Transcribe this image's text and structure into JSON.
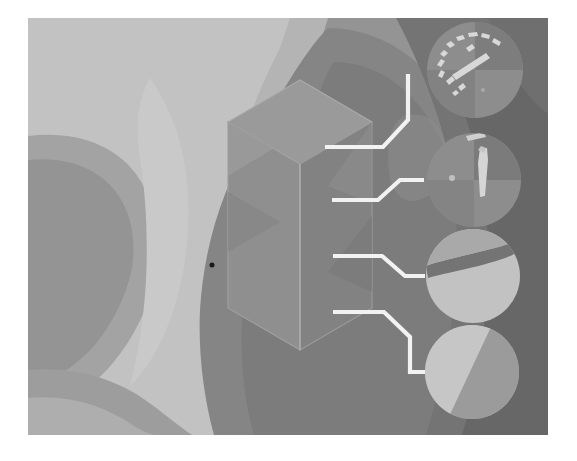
{
  "figure": {
    "domain": "scientific-visualization",
    "kind": "contour-field-map-with-isometric-cell-and-circular-insets",
    "caption": "",
    "canvas": {
      "x": 28,
      "y": 18,
      "width": 520,
      "height": 417,
      "page_background": "#ffffff",
      "plot_background": "#8f8f8f"
    },
    "palette": {
      "level_0_lightest": "#c9c9c9",
      "level_1_light": "#b4b4b4",
      "level_2_midlight": "#a3a3a3",
      "level_3_mid": "#949494",
      "level_4_middark": "#858585",
      "level_5_dark": "#747474",
      "level_6_darkest": "#636363",
      "box_top_face": "#9a9a9a",
      "box_left_face": "#8c8c8c",
      "box_right_face": "#7e7e7e",
      "box_edge": "#a8a8a8",
      "leader_line": "#f2f2f2",
      "marker_dot": "#1a1a1a",
      "inset_light": "#c2c2c2",
      "inset_mid": "#9b9b9b",
      "inset_dark": "#6f6f6f",
      "inset_highlight": "#dedede"
    }
  },
  "contour_field": {
    "description": "Grayscale stepped contour bands forming a lobed field across the frame",
    "level_count": 7,
    "bands": [
      {
        "id": "band-background",
        "level": 3,
        "fill": "#949494"
      },
      {
        "id": "band-upper-left-plateau",
        "level": 1,
        "fill": "#b4b4b4"
      },
      {
        "id": "band-left-valley-core",
        "level": 0,
        "fill": "#c9c9c9"
      },
      {
        "id": "band-left-ridge",
        "level": 4,
        "fill": "#858585"
      },
      {
        "id": "band-central-dome",
        "level": 4,
        "fill": "#858585"
      },
      {
        "id": "band-lower-basin",
        "level": 2,
        "fill": "#a3a3a3"
      },
      {
        "id": "band-right-trough",
        "level": 5,
        "fill": "#747474"
      },
      {
        "id": "band-right-edge-lobe",
        "level": 6,
        "fill": "#636363"
      }
    ]
  },
  "unit_cell": {
    "name": "isometric-box",
    "type": "hexagonal-prism-projection",
    "apex_top": [
      300,
      80
    ],
    "apex_bottom": [
      300,
      350
    ],
    "faces": [
      {
        "id": "top-face",
        "fill": "#9a9a9a"
      },
      {
        "id": "left-face",
        "fill": "#8c8c8c"
      },
      {
        "id": "right-face",
        "fill": "#7e7e7e"
      },
      {
        "id": "inner-chevron",
        "fill": "#8f8f8f"
      }
    ]
  },
  "marker": {
    "name": "point-marker",
    "x": 212,
    "y": 265,
    "radius": 2.5,
    "color": "#1a1a1a"
  },
  "leader_lines": [
    {
      "id": "leader-1",
      "target_inset": "inset-1",
      "path": "M 325 147 L 383 147 L 408 120 L 408 74",
      "shape": "horizontal-diagonal-vertical-up"
    },
    {
      "id": "leader-2",
      "target_inset": "inset-2",
      "path": "M 332 200 L 378 200 L 400 180 L 424 180",
      "shape": "horizontal-diagonal-up-horizontal"
    },
    {
      "id": "leader-3",
      "target_inset": "inset-3",
      "path": "M 333 256 L 382 256 L 405 276 L 425 276",
      "shape": "horizontal-diagonal-down-horizontal"
    },
    {
      "id": "leader-4",
      "target_inset": "inset-4",
      "path": "M 333 312 L 384 312 L 410 337 L 410 372 L 428 372",
      "shape": "horizontal-diagonal-down-vertical-horizontal"
    }
  ],
  "insets": [
    {
      "id": "inset-1",
      "label": "",
      "center": [
        475,
        70
      ],
      "radius": 48,
      "base_fill": "#8d8d8d",
      "ring_fill": "#7a7a7a",
      "pattern": "speckled-arc-filaments",
      "feature_description": "Dense bright filament fragments tracing an arc across upper-left of the disc"
    },
    {
      "id": "inset-2",
      "label": "",
      "center": [
        474,
        180
      ],
      "radius": 47,
      "base_fill": "#8d8d8d",
      "ring_fill": "#7a7a7a",
      "pattern": "vertical-bright-streak",
      "feature_description": "Single elongated vertical bright streak near disc center"
    },
    {
      "id": "inset-3",
      "label": "",
      "center": [
        473,
        276
      ],
      "radius": 47,
      "base_fill": "#c2c2c2",
      "ring_fill": "#7a7a7a",
      "pattern": "horizontal-dark-band",
      "feature_description": "Light disc crossed by a dark horizontal band in the upper third"
    },
    {
      "id": "inset-4",
      "label": "",
      "center": [
        472,
        372
      ],
      "radius": 47,
      "base_fill": "#a6a6a6",
      "ring_fill": "#7a7a7a",
      "pattern": "diagonal-split",
      "feature_description": "Disc split by a diagonal boundary; lighter wedge on left, darker region on right"
    }
  ]
}
